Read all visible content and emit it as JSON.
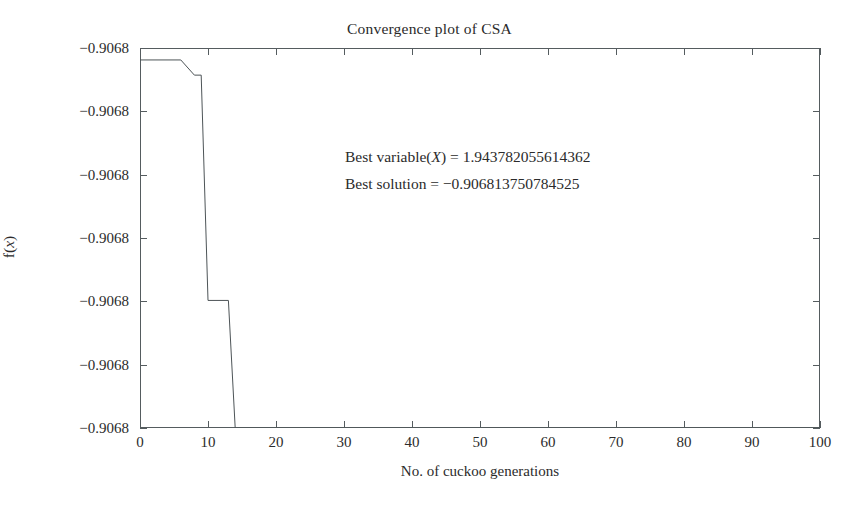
{
  "chart_data": {
    "type": "line",
    "title": "Convergence plot of CSA",
    "xlabel": "No. of cuckoo generations",
    "ylabel": "f(x)",
    "ylabel_parts": {
      "f": "f",
      "open": "(",
      "var": "x",
      "close": ")"
    },
    "xlim": [
      0,
      100
    ],
    "xticks": [
      0,
      10,
      20,
      30,
      40,
      50,
      60,
      70,
      80,
      90,
      100
    ],
    "xticklabels": [
      "0",
      "10",
      "20",
      "30",
      "40",
      "50",
      "60",
      "70",
      "80",
      "90",
      "100"
    ],
    "yticklabels": [
      "-0.9068",
      "-0.9068",
      "-0.9068",
      "-0.9068",
      "-0.9068",
      "-0.9068",
      "-0.9068"
    ],
    "ylim": [
      -0.90681375,
      -0.90680675
    ],
    "ytick_values": [
      -0.90680675,
      -0.90680792,
      -0.90680908,
      -0.90681025,
      -0.90681142,
      -0.90681258,
      -0.90681375
    ],
    "grid": false,
    "legend": null,
    "series": [
      {
        "name": "Best solution so far",
        "color": "#4d5457",
        "linewidth": 1,
        "x": [
          0,
          6,
          8,
          9,
          10,
          13,
          14,
          15,
          100
        ],
        "y": [
          -0.90680697,
          -0.90680697,
          -0.90680725,
          -0.90680725,
          -0.9068114,
          -0.9068114,
          -0.90681375,
          -0.90681375,
          -0.90681375
        ],
        "step_points": [
          {
            "gen": 0,
            "value": -0.90680697
          },
          {
            "gen": 6,
            "value": -0.90680697
          },
          {
            "gen": 8,
            "value": -0.90680725
          },
          {
            "gen": 9,
            "value": -0.90680725
          },
          {
            "gen": 10,
            "value": -0.9068114
          },
          {
            "gen": 13,
            "value": -0.9068114
          },
          {
            "gen": 14,
            "value": -0.90681375
          },
          {
            "gen": 100,
            "value": -0.90681375
          }
        ]
      }
    ],
    "annotations": [
      {
        "id": "best-variable",
        "prefix": "Best variable(",
        "italic": "X",
        "suffix": ") = 1.943782055614362",
        "text": "Best variable(X) = 1.943782055614362"
      },
      {
        "id": "best-solution",
        "prefix": "Best solution = ",
        "italic": "",
        "suffix": "−0.906813750784525",
        "text": "Best solution = −0.906813750784525"
      }
    ],
    "colors": {
      "axis": "#555c5f",
      "line": "#4d5457",
      "text": "#2b2b2b",
      "background": "#ffffff"
    }
  }
}
